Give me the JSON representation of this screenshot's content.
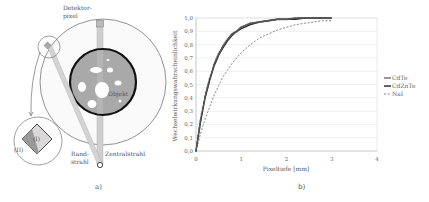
{
  "panel_a": {
    "caption": "a)",
    "labels": {
      "detector_line1": "Detektor-",
      "detector_line2": "pixel",
      "object": "Objekt",
      "edge_ray_line1": "Rand-",
      "edge_ray_line2": "strahl",
      "central_ray": "Zentralstrahl",
      "region_1": "(I)",
      "region_2": "(II)"
    },
    "colors": {
      "object_fill": "#a9a9a9",
      "object_border": "#111111",
      "ray_fill": "#c8c8c8",
      "inclusion_fill": "#ffffff",
      "outline": "#888888"
    }
  },
  "panel_b": {
    "caption": "b)"
  },
  "chart_data": {
    "type": "line",
    "title": "",
    "xlabel": "Pixeltiefe [mm]",
    "ylabel": "Wechselwirkungswahrscheinlichkeit",
    "xlim": [
      0,
      4
    ],
    "ylim": [
      0.0,
      1.0
    ],
    "x_ticks": [
      "0",
      "1",
      "2",
      "3",
      "4"
    ],
    "y_ticks": [
      "0,0",
      "0,1",
      "0,2",
      "0,3",
      "0,4",
      "0,5",
      "0,6",
      "0,7",
      "0,8",
      "0,9",
      "1,0"
    ],
    "grid": "horizontal",
    "legend_position": "right",
    "x": [
      0,
      0.1,
      0.2,
      0.3,
      0.4,
      0.5,
      0.6,
      0.7,
      0.8,
      0.9,
      1.0,
      1.2,
      1.4,
      1.6,
      1.8,
      2.0,
      2.2,
      2.4,
      2.6,
      2.8,
      3.0
    ],
    "series": [
      {
        "name": "CdTe",
        "style": "solid-marker",
        "color": "#555555",
        "values": [
          0.0,
          0.23,
          0.41,
          0.54,
          0.65,
          0.73,
          0.79,
          0.84,
          0.88,
          0.9,
          0.93,
          0.96,
          0.97,
          0.98,
          0.99,
          0.99,
          1.0,
          1.0,
          1.0,
          1.0,
          1.0
        ]
      },
      {
        "name": "CdZnTe",
        "style": "solid",
        "color": "#222222",
        "values": [
          0.0,
          0.22,
          0.4,
          0.53,
          0.64,
          0.72,
          0.78,
          0.83,
          0.87,
          0.9,
          0.92,
          0.95,
          0.97,
          0.98,
          0.99,
          0.99,
          0.99,
          1.0,
          1.0,
          1.0,
          1.0
        ]
      },
      {
        "name": "NaI",
        "style": "dashed",
        "color": "#777777",
        "values": [
          0.0,
          0.13,
          0.24,
          0.33,
          0.42,
          0.49,
          0.56,
          0.61,
          0.66,
          0.7,
          0.74,
          0.8,
          0.85,
          0.88,
          0.91,
          0.93,
          0.95,
          0.96,
          0.97,
          0.98,
          0.98
        ]
      }
    ]
  }
}
